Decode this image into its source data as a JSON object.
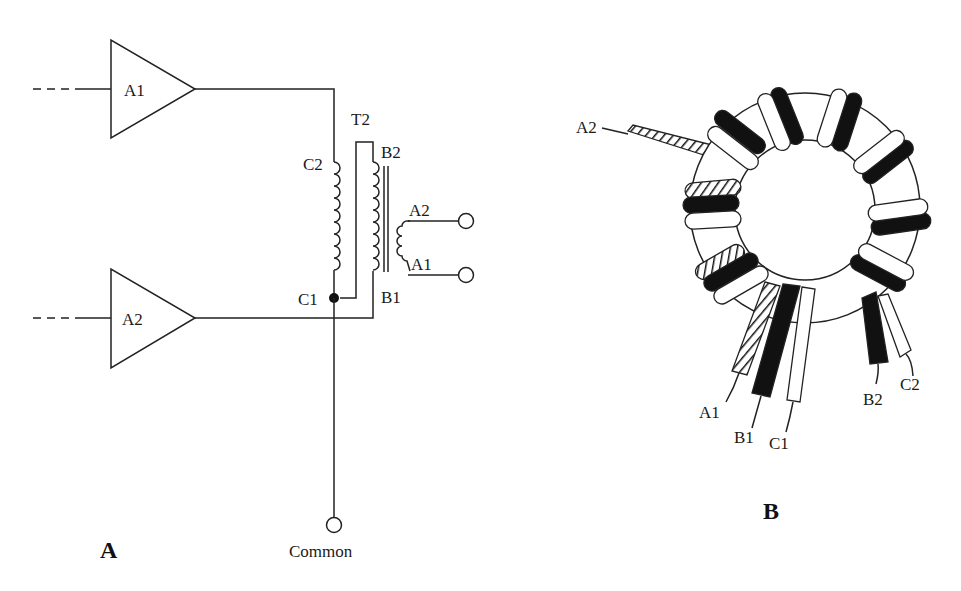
{
  "panels": {
    "a": {
      "label": "A",
      "amplifiers": [
        {
          "name": "A1"
        },
        {
          "name": "A2"
        }
      ],
      "transformer": {
        "label": "T2",
        "winding_c": {
          "top": "C2",
          "bottom": "C1"
        },
        "winding_b": {
          "top": "B2",
          "bottom": "B1"
        },
        "output": {
          "top": "A2",
          "bottom": "A1"
        }
      },
      "common_label": "Common"
    },
    "b": {
      "label": "B",
      "leads": {
        "a2": "A2",
        "a1": "A1",
        "b1": "B1",
        "c1": "C1",
        "b2": "B2",
        "c2": "C2"
      }
    }
  },
  "colors": {
    "line": "#222222",
    "black_wire": "#111111",
    "white_wire": "#ffffff",
    "background": "#ffffff"
  }
}
